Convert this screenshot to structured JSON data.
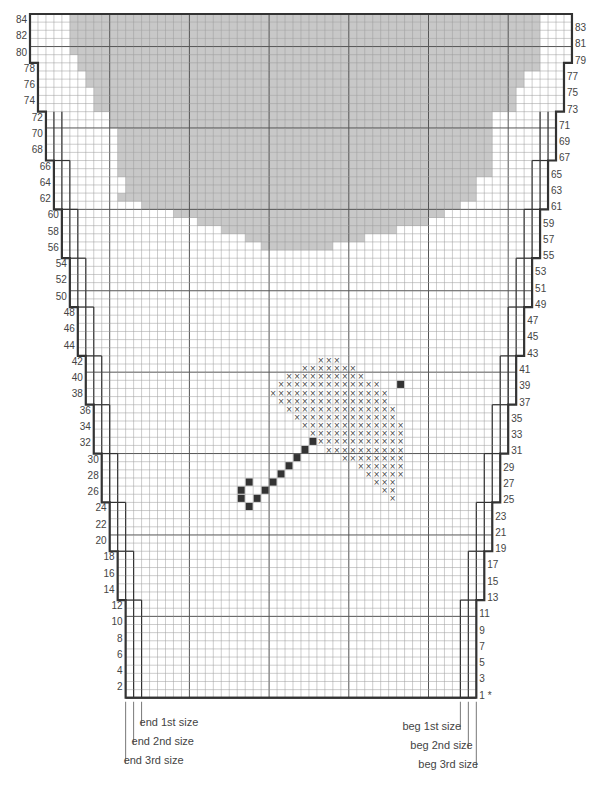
{
  "chart_data": {
    "type": "knitting-chart",
    "title": "",
    "rows": 84,
    "columns_top": 68,
    "columns_bottom": 44,
    "row_labels_left": [
      84,
      82,
      80,
      78,
      76,
      74,
      72,
      70,
      68,
      66,
      64,
      62,
      60,
      58,
      56,
      54,
      52,
      50,
      48,
      46,
      44,
      42,
      40,
      38,
      36,
      34,
      32,
      30,
      28,
      26,
      24,
      22,
      20,
      18,
      16,
      14,
      12,
      10,
      8,
      6,
      4,
      2
    ],
    "row_labels_right": [
      83,
      81,
      79,
      77,
      75,
      73,
      71,
      69,
      67,
      65,
      63,
      61,
      59,
      57,
      55,
      53,
      51,
      49,
      47,
      45,
      43,
      41,
      39,
      37,
      35,
      33,
      31,
      29,
      27,
      25,
      23,
      21,
      19,
      17,
      15,
      13,
      11,
      9,
      7,
      5,
      3,
      1
    ],
    "row_one_marker": "*",
    "size_lines": {
      "left": [
        "end 1st size",
        "end 2nd size",
        "end 3rd size"
      ],
      "right": [
        "beg 1st size",
        "beg 2nd size",
        "beg 3rd size"
      ]
    },
    "shaded_area": {
      "description": "grey shaded neckline/yoke area at top of chart",
      "rows_top": 84,
      "rows_bottom": 56,
      "profile": [
        {
          "row": 84,
          "left": 5,
          "right": 64
        },
        {
          "row": 79,
          "left": 6,
          "right": 64
        },
        {
          "row": 77,
          "left": 7,
          "right": 62
        },
        {
          "row": 75,
          "left": 8,
          "right": 61
        },
        {
          "row": 72,
          "left": 10,
          "right": 58
        },
        {
          "row": 70,
          "left": 11,
          "right": 58
        },
        {
          "row": 62,
          "left": 11,
          "right": 56
        },
        {
          "row": 64,
          "left": 12,
          "right": 56
        },
        {
          "row": 61,
          "left": 14,
          "right": 54
        },
        {
          "row": 60,
          "left": 18,
          "right": 52
        },
        {
          "row": 59,
          "left": 21,
          "right": 50
        },
        {
          "row": 58,
          "left": 24,
          "right": 46
        },
        {
          "row": 57,
          "left": 27,
          "right": 42
        },
        {
          "row": 56,
          "left": 29,
          "right": 38
        }
      ]
    },
    "motif": {
      "name": "umbrella",
      "cross_symbol": "×",
      "solid_symbol": "■",
      "cross_rows": [
        {
          "row": 42,
          "cols": [
            36,
            37,
            38
          ]
        },
        {
          "row": 41,
          "cols": [
            34,
            35,
            36,
            37,
            38,
            39,
            40
          ]
        },
        {
          "row": 40,
          "cols": [
            32,
            33,
            34,
            35,
            36,
            37,
            38,
            39,
            40,
            41
          ]
        },
        {
          "row": 39,
          "cols": [
            31,
            32,
            33,
            34,
            35,
            36,
            37,
            38,
            39,
            40,
            41,
            42,
            43
          ]
        },
        {
          "row": 38,
          "cols": [
            30,
            31,
            32,
            33,
            34,
            35,
            36,
            37,
            38,
            39,
            40,
            41,
            42,
            43,
            44
          ]
        },
        {
          "row": 37,
          "cols": [
            31,
            32,
            33,
            34,
            35,
            36,
            37,
            38,
            39,
            40,
            41,
            42,
            43,
            44
          ]
        },
        {
          "row": 36,
          "cols": [
            32,
            33,
            34,
            35,
            36,
            37,
            38,
            39,
            40,
            41,
            42,
            43,
            44,
            45
          ]
        },
        {
          "row": 35,
          "cols": [
            33,
            34,
            35,
            36,
            37,
            38,
            39,
            40,
            41,
            42,
            43,
            44,
            45
          ]
        },
        {
          "row": 34,
          "cols": [
            34,
            35,
            36,
            37,
            38,
            39,
            40,
            41,
            42,
            43,
            44,
            45,
            46
          ]
        },
        {
          "row": 33,
          "cols": [
            35,
            36,
            37,
            38,
            39,
            40,
            41,
            42,
            43,
            44,
            45,
            46
          ]
        },
        {
          "row": 32,
          "cols": [
            36,
            37,
            38,
            39,
            40,
            41,
            42,
            43,
            44,
            45,
            46
          ]
        },
        {
          "row": 31,
          "cols": [
            37,
            38,
            39,
            40,
            41,
            42,
            43,
            44,
            45,
            46
          ]
        },
        {
          "row": 30,
          "cols": [
            39,
            40,
            41,
            42,
            43,
            44,
            45,
            46
          ]
        },
        {
          "row": 29,
          "cols": [
            41,
            42,
            43,
            44,
            45,
            46
          ]
        },
        {
          "row": 28,
          "cols": [
            42,
            43,
            44,
            45,
            46
          ]
        },
        {
          "row": 27,
          "cols": [
            43,
            44,
            45
          ]
        },
        {
          "row": 26,
          "cols": [
            44,
            45
          ]
        },
        {
          "row": 25,
          "cols": [
            45
          ]
        }
      ],
      "solid_cells": [
        {
          "row": 39,
          "col": 46
        },
        {
          "row": 32,
          "col": 35
        },
        {
          "row": 31,
          "col": 34
        },
        {
          "row": 30,
          "col": 33
        },
        {
          "row": 29,
          "col": 32
        },
        {
          "row": 28,
          "col": 31
        },
        {
          "row": 27,
          "col": 30
        },
        {
          "row": 27,
          "col": 27
        },
        {
          "row": 26,
          "col": 26
        },
        {
          "row": 26,
          "col": 29
        },
        {
          "row": 25,
          "col": 26
        },
        {
          "row": 25,
          "col": 28
        },
        {
          "row": 24,
          "col": 27
        }
      ]
    },
    "colors": {
      "shading": "#c8c8c8",
      "grid_minor": "#9a9a9a",
      "grid_major": "#555555",
      "outline": "#333333",
      "solid": "#333333"
    }
  }
}
